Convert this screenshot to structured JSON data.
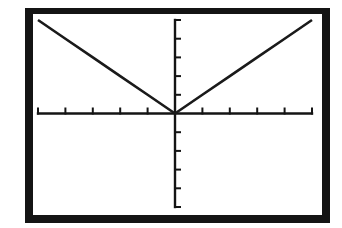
{
  "screen": {
    "title": "Graph of y = |x|"
  },
  "chart_data": {
    "type": "line",
    "title": "",
    "function": "y = abs(x)",
    "xlabel": "",
    "ylabel": "",
    "xlim": [
      -5,
      5
    ],
    "ylim": [
      -5,
      5
    ],
    "xscl": 1,
    "yscl": 1,
    "grid": false,
    "legend": "none",
    "series": [
      {
        "name": "Y1",
        "x": [
          -5,
          -4,
          -3,
          -2,
          -1,
          0,
          1,
          2,
          3,
          4,
          5
        ],
        "values": [
          5,
          4,
          3,
          2,
          1,
          0,
          1,
          2,
          3,
          4,
          5
        ]
      }
    ]
  },
  "colors": {
    "frame": "#141414",
    "axis": "#141414",
    "curve": "#1a1a1a",
    "background": "#ffffff"
  }
}
